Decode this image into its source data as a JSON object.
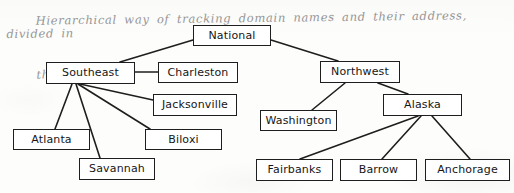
{
  "annotation": {
    "line1": "Hierarchical way of tracking domain names and their address, divided in",
    "line2": "the mid 1980s"
  },
  "diagram": {
    "type": "tree",
    "nodes": [
      {
        "id": "national",
        "label": "National",
        "x": 193,
        "y": 25,
        "w": 78,
        "h": 21
      },
      {
        "id": "southeast",
        "label": "Southeast",
        "x": 46,
        "y": 62,
        "w": 89,
        "h": 22
      },
      {
        "id": "charleston",
        "label": "Charleston",
        "x": 158,
        "y": 62,
        "w": 80,
        "h": 21
      },
      {
        "id": "jacksonville",
        "label": "Jacksonville",
        "x": 153,
        "y": 94,
        "w": 84,
        "h": 22
      },
      {
        "id": "atlanta",
        "label": "Atlanta",
        "x": 13,
        "y": 129,
        "w": 77,
        "h": 21
      },
      {
        "id": "biloxi",
        "label": "Biloxi",
        "x": 145,
        "y": 129,
        "w": 77,
        "h": 21
      },
      {
        "id": "savannah",
        "label": "Savannah",
        "x": 79,
        "y": 158,
        "w": 76,
        "h": 22
      },
      {
        "id": "northwest",
        "label": "Northwest",
        "x": 320,
        "y": 61,
        "w": 80,
        "h": 22
      },
      {
        "id": "washington",
        "label": "Washington",
        "x": 260,
        "y": 110,
        "w": 77,
        "h": 21
      },
      {
        "id": "alaska",
        "label": "Alaska",
        "x": 383,
        "y": 94,
        "w": 79,
        "h": 22
      },
      {
        "id": "fairbanks",
        "label": "Fairbanks",
        "x": 256,
        "y": 159,
        "w": 77,
        "h": 22
      },
      {
        "id": "barrow",
        "label": "Barrow",
        "x": 340,
        "y": 159,
        "w": 77,
        "h": 22
      },
      {
        "id": "anchorage",
        "label": "Anchorage",
        "x": 425,
        "y": 159,
        "w": 85,
        "h": 22
      }
    ],
    "edges": [
      {
        "from": "national",
        "to": "southeast",
        "x1": 193,
        "y1": 40,
        "x2": 120,
        "y2": 62
      },
      {
        "from": "national",
        "to": "northwest",
        "x1": 271,
        "y1": 40,
        "x2": 338,
        "y2": 61
      },
      {
        "from": "southeast",
        "to": "charleston",
        "x1": 135,
        "y1": 72,
        "x2": 158,
        "y2": 72
      },
      {
        "from": "southeast",
        "to": "jacksonville",
        "x1": 80,
        "y1": 84,
        "x2": 153,
        "y2": 100
      },
      {
        "from": "southeast",
        "to": "biloxi",
        "x1": 78,
        "y1": 84,
        "x2": 150,
        "y2": 129
      },
      {
        "from": "southeast",
        "to": "atlanta",
        "x1": 72,
        "y1": 84,
        "x2": 55,
        "y2": 129
      },
      {
        "from": "southeast",
        "to": "savannah",
        "x1": 76,
        "y1": 84,
        "x2": 100,
        "y2": 158
      },
      {
        "from": "northwest",
        "to": "washington",
        "x1": 345,
        "y1": 83,
        "x2": 312,
        "y2": 110
      },
      {
        "from": "northwest",
        "to": "alaska",
        "x1": 378,
        "y1": 83,
        "x2": 408,
        "y2": 94
      },
      {
        "from": "alaska",
        "to": "fairbanks",
        "x1": 418,
        "y1": 116,
        "x2": 300,
        "y2": 159
      },
      {
        "from": "alaska",
        "to": "barrow",
        "x1": 421,
        "y1": 116,
        "x2": 382,
        "y2": 159
      },
      {
        "from": "alaska",
        "to": "anchorage",
        "x1": 432,
        "y1": 116,
        "x2": 470,
        "y2": 159
      }
    ]
  },
  "style": {
    "stroke": "#1e1e1e",
    "node_fill": "#ffffff",
    "text_color": "#161616",
    "annotation_color": "#8d8d8d",
    "paper": "#fdfdfc"
  }
}
